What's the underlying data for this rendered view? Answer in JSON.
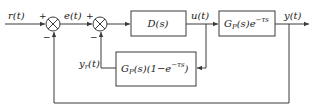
{
  "diagram": {
    "type": "block-diagram",
    "signals": {
      "input": "r(t)",
      "error": "e(t)",
      "control": "u(t)",
      "output": "y(t)",
      "predictor_output_main": "y",
      "predictor_output_sub": "r",
      "predictor_output_tail": "(t)"
    },
    "blocks": {
      "controller": "D(s)",
      "plant_main": "G",
      "plant_sub": "P",
      "plant_tail": "(s)e",
      "plant_sup": "−τs",
      "predictor_main": "G",
      "predictor_sub": "P",
      "predictor_mid": "(s)(1−e",
      "predictor_sup": "−τs",
      "predictor_tail": ")"
    },
    "summing_junctions": [
      {
        "id": "sum1",
        "plus": "+",
        "minus": "−"
      },
      {
        "id": "sum2",
        "plus": "+",
        "minus": "−"
      }
    ],
    "colors": {
      "line": "#3a3a3a",
      "text": "#222222",
      "background": "#ffffff"
    }
  }
}
